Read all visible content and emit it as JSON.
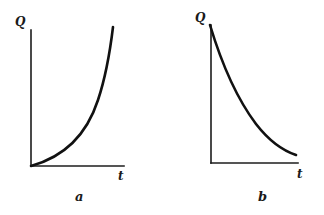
{
  "figure": {
    "panels": [
      {
        "id": "a",
        "caption": "a",
        "y_label": "Q",
        "x_label": "t",
        "curve": "increasing, concave up (accelerating growth from origin)"
      },
      {
        "id": "b",
        "caption": "b",
        "y_label": "Q",
        "x_label": "t",
        "curve": "decreasing, convex (exponential-like decay toward t-axis)"
      }
    ],
    "colors": {
      "background": "#ffffff",
      "ink": "#111111"
    }
  }
}
